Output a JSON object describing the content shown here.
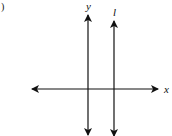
{
  "figure": {
    "paren": ")",
    "labels": {
      "y_axis": "y",
      "line": "l",
      "x_axis": "x"
    }
  }
}
